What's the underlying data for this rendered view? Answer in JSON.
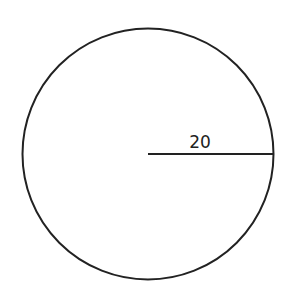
{
  "diagram": {
    "shape": "circle",
    "radius_label": "20",
    "stroke_color": "#222222",
    "background": "#ffffff"
  }
}
